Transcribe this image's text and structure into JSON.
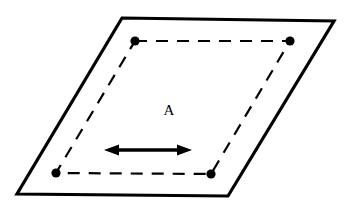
{
  "figure": {
    "background_color": "#ffffff",
    "stroke_color": "#000000",
    "label": {
      "text": "A",
      "x": 169,
      "y": 112,
      "font_size": 15
    },
    "outer_plane": {
      "name": "solid-parallelogram",
      "stroke_color": "#000000",
      "stroke_width": 3.2,
      "fill": "none",
      "points": [
        {
          "x": 122,
          "y": 18
        },
        {
          "x": 334,
          "y": 21
        },
        {
          "x": 228,
          "y": 196
        },
        {
          "x": 17,
          "y": 194
        }
      ],
      "points_attr": "122,18 334,21 228,196 17,194"
    },
    "inner_loop": {
      "name": "dashed-quadrilateral",
      "stroke_color": "#000000",
      "stroke_width": 2.2,
      "fill": "none",
      "dash_pattern": "12 9",
      "points": [
        {
          "x": 135,
          "y": 41
        },
        {
          "x": 290,
          "y": 41
        },
        {
          "x": 211,
          "y": 174
        },
        {
          "x": 56,
          "y": 173
        }
      ],
      "points_attr": "135,41 290,41 211,174 56,173"
    },
    "vertex_dots": {
      "name": "corner-nodes",
      "color": "#000000",
      "radius": 4.6,
      "items": [
        {
          "name": "node-top-left",
          "x": 135,
          "y": 41
        },
        {
          "name": "node-top-right",
          "x": 290,
          "y": 41
        },
        {
          "name": "node-bottom-right",
          "x": 211,
          "y": 174
        },
        {
          "name": "node-bottom-left",
          "x": 56,
          "y": 173
        }
      ]
    },
    "arrow": {
      "name": "double-headed-arrow",
      "color": "#000000",
      "shaft_width": 3.6,
      "x1": 104,
      "y1": 150,
      "x2": 192,
      "y2": 150,
      "head_length": 14,
      "head_half_width": 5.5,
      "shaft_path": "M 116 150 L 180 150",
      "left_head_points": "104,150 119,144.5 119,155.5",
      "right_head_points": "192,150 177,144.5 177,155.5"
    }
  }
}
